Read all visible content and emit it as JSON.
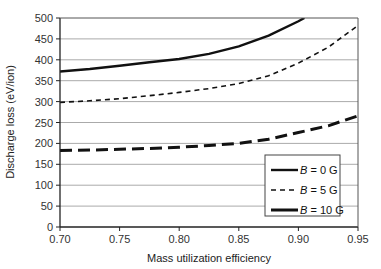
{
  "chart_data": {
    "type": "line",
    "title": "",
    "xlabel": "Mass utilization efficiency",
    "ylabel": "Discharge loss (eV/ion)",
    "xlim": [
      0.7,
      0.95
    ],
    "ylim": [
      0,
      500
    ],
    "xticks": [
      "0.70",
      "0.75",
      "0.80",
      "0.85",
      "0.90",
      "0.95"
    ],
    "yticks": [
      "0",
      "50",
      "100",
      "150",
      "200",
      "250",
      "300",
      "350",
      "400",
      "450",
      "500"
    ],
    "grid": "horizontal",
    "legend_position": "bottom-right",
    "series": [
      {
        "name": "B = 0 G",
        "label_var": "B",
        "label_rest": " = 0 G",
        "style": "solid",
        "x": [
          0.7,
          0.725,
          0.75,
          0.775,
          0.8,
          0.825,
          0.85,
          0.875,
          0.9,
          0.905
        ],
        "y": [
          372,
          378,
          386,
          394,
          402,
          414,
          432,
          458,
          492,
          500
        ]
      },
      {
        "name": "B = 5 G",
        "label_var": "B",
        "label_rest": " = 5 G",
        "style": "dashed",
        "x": [
          0.7,
          0.725,
          0.75,
          0.775,
          0.8,
          0.825,
          0.85,
          0.875,
          0.9,
          0.925,
          0.95
        ],
        "y": [
          298,
          302,
          307,
          314,
          322,
          331,
          343,
          362,
          392,
          430,
          482
        ]
      },
      {
        "name": "B = 10 G",
        "label_var": "B",
        "label_rest": " = 10 G",
        "style": "long-dashed",
        "x": [
          0.7,
          0.725,
          0.75,
          0.775,
          0.8,
          0.825,
          0.85,
          0.875,
          0.9,
          0.925,
          0.95
        ],
        "y": [
          183,
          184,
          186,
          188,
          191,
          195,
          200,
          210,
          226,
          242,
          266
        ]
      }
    ]
  }
}
